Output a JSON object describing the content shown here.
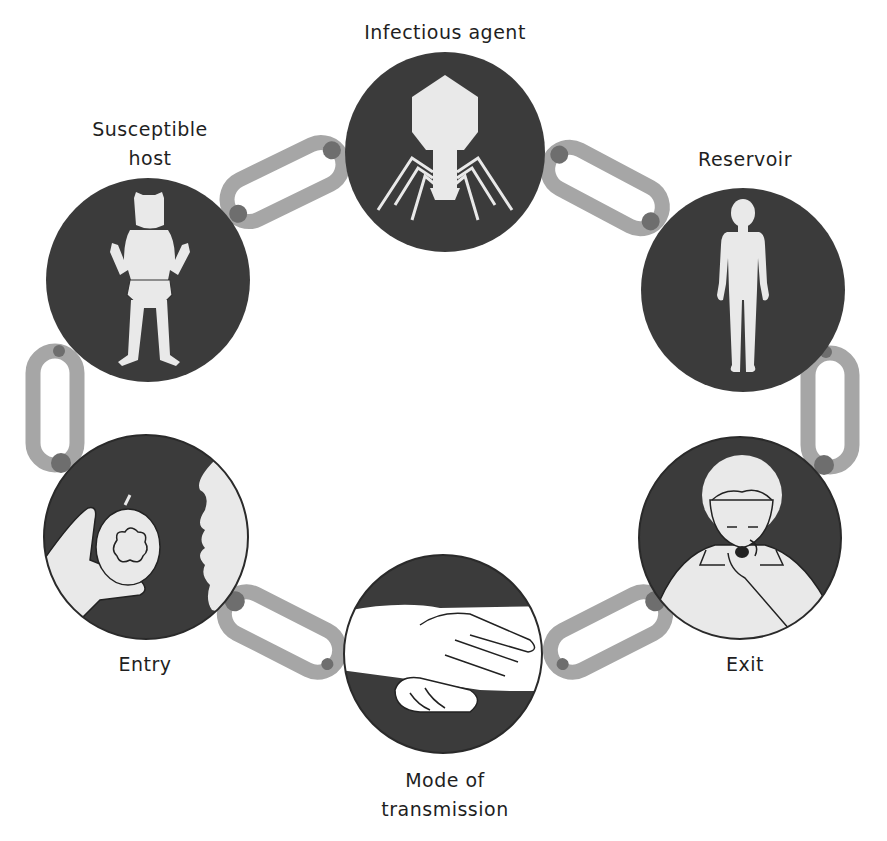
{
  "diagram": {
    "type": "chain-of-infection",
    "colors": {
      "circle_fill": "#3b3b3b",
      "figure_fill": "#e9e9e9",
      "link_color": "#a6a6a6",
      "link_joint": "#6e6e6e",
      "text": "#1f1f1f",
      "background": "#ffffff"
    },
    "nodes": [
      {
        "id": "infectious-agent",
        "label_lines": [
          "Infectious agent"
        ],
        "icon": "bacteriophage-icon"
      },
      {
        "id": "reservoir",
        "label_lines": [
          "Reservoir"
        ],
        "icon": "human-figure-icon"
      },
      {
        "id": "exit",
        "label_lines": [
          "Exit"
        ],
        "icon": "coughing-person-icon"
      },
      {
        "id": "mode-of-transmission",
        "label_lines": [
          "Mode of",
          "transmission"
        ],
        "icon": "handshake-icon"
      },
      {
        "id": "entry",
        "label_lines": [
          "Entry"
        ],
        "icon": "apple-mouth-icon"
      },
      {
        "id": "susceptible-host",
        "label_lines": [
          "Susceptible",
          "host"
        ],
        "icon": "baby-icon"
      }
    ],
    "links": [
      {
        "from": "susceptible-host",
        "to": "infectious-agent"
      },
      {
        "from": "infectious-agent",
        "to": "reservoir"
      },
      {
        "from": "reservoir",
        "to": "exit"
      },
      {
        "from": "exit",
        "to": "mode-of-transmission"
      },
      {
        "from": "mode-of-transmission",
        "to": "entry"
      },
      {
        "from": "entry",
        "to": "susceptible-host"
      }
    ]
  }
}
